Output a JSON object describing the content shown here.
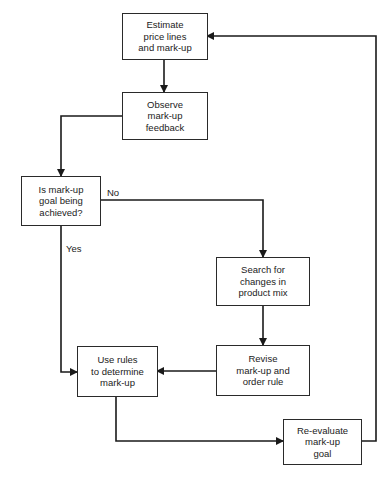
{
  "diagram": {
    "type": "flowchart",
    "nodes": [
      {
        "id": "estimate",
        "lines": [
          "Estimate",
          "price lines",
          "and mark-up"
        ]
      },
      {
        "id": "observe",
        "lines": [
          "Observe",
          "mark-up",
          "feedback"
        ]
      },
      {
        "id": "decision",
        "lines": [
          "Is mark-up",
          "goal being",
          "achieved?"
        ]
      },
      {
        "id": "search",
        "lines": [
          "Search for",
          "changes in",
          "product mix"
        ]
      },
      {
        "id": "revise",
        "lines": [
          "Revise",
          "mark-up and",
          "order rule"
        ]
      },
      {
        "id": "use_rules",
        "lines": [
          "Use rules",
          "to determine",
          "mark-up"
        ]
      },
      {
        "id": "reevaluate",
        "lines": [
          "Re-evaluate",
          "mark-up",
          "goal"
        ]
      }
    ],
    "edge_labels": {
      "no": "No",
      "yes": "Yes"
    },
    "edges": [
      {
        "from": "estimate",
        "to": "observe"
      },
      {
        "from": "observe",
        "to": "decision"
      },
      {
        "from": "decision",
        "to": "search",
        "label": "No"
      },
      {
        "from": "decision",
        "to": "use_rules",
        "label": "Yes"
      },
      {
        "from": "search",
        "to": "revise"
      },
      {
        "from": "revise",
        "to": "use_rules"
      },
      {
        "from": "use_rules",
        "to": "reevaluate"
      },
      {
        "from": "reevaluate",
        "to": "estimate"
      }
    ],
    "colors": {
      "line": "#1a1a1a",
      "border": "#2a2a2a",
      "background": "#ffffff"
    }
  }
}
